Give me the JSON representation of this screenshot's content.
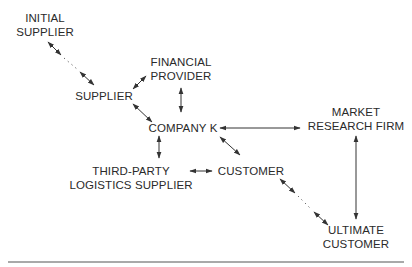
{
  "diagram": {
    "type": "network",
    "nodes": [
      {
        "id": "initial_supplier",
        "line1": "INITIAL",
        "line2": "SUPPLIER"
      },
      {
        "id": "financial_provider",
        "line1": "FINANCIAL",
        "line2": "PROVIDER"
      },
      {
        "id": "supplier",
        "line1": "SUPPLIER"
      },
      {
        "id": "company_k",
        "line1": "COMPANY K"
      },
      {
        "id": "market_research_firm",
        "line1": "MARKET",
        "line2": "RESEARCH FIRM"
      },
      {
        "id": "third_party_logistics",
        "line1": "THIRD-PARTY",
        "line2": "LOGISTICS SUPPLIER"
      },
      {
        "id": "customer",
        "line1": "CUSTOMER"
      },
      {
        "id": "ultimate_customer",
        "line1": "ULTIMATE",
        "line2": "CUSTOMER"
      }
    ],
    "edges": [
      {
        "from": "initial_supplier",
        "to": "supplier",
        "style": "bidirectional-dotted"
      },
      {
        "from": "supplier",
        "to": "financial_provider",
        "style": "bidirectional"
      },
      {
        "from": "supplier",
        "to": "company_k",
        "style": "bidirectional"
      },
      {
        "from": "financial_provider",
        "to": "company_k",
        "style": "bidirectional"
      },
      {
        "from": "company_k",
        "to": "market_research_firm",
        "style": "bidirectional"
      },
      {
        "from": "company_k",
        "to": "third_party_logistics",
        "style": "bidirectional"
      },
      {
        "from": "company_k",
        "to": "customer",
        "style": "bidirectional"
      },
      {
        "from": "third_party_logistics",
        "to": "customer",
        "style": "bidirectional"
      },
      {
        "from": "market_research_firm",
        "to": "ultimate_customer",
        "style": "bidirectional"
      },
      {
        "from": "customer",
        "to": "ultimate_customer",
        "style": "bidirectional-dotted"
      }
    ]
  },
  "colors": {
    "text": "#2a2a2a",
    "line": "#333333",
    "rule": "#555555",
    "background": "#ffffff"
  }
}
